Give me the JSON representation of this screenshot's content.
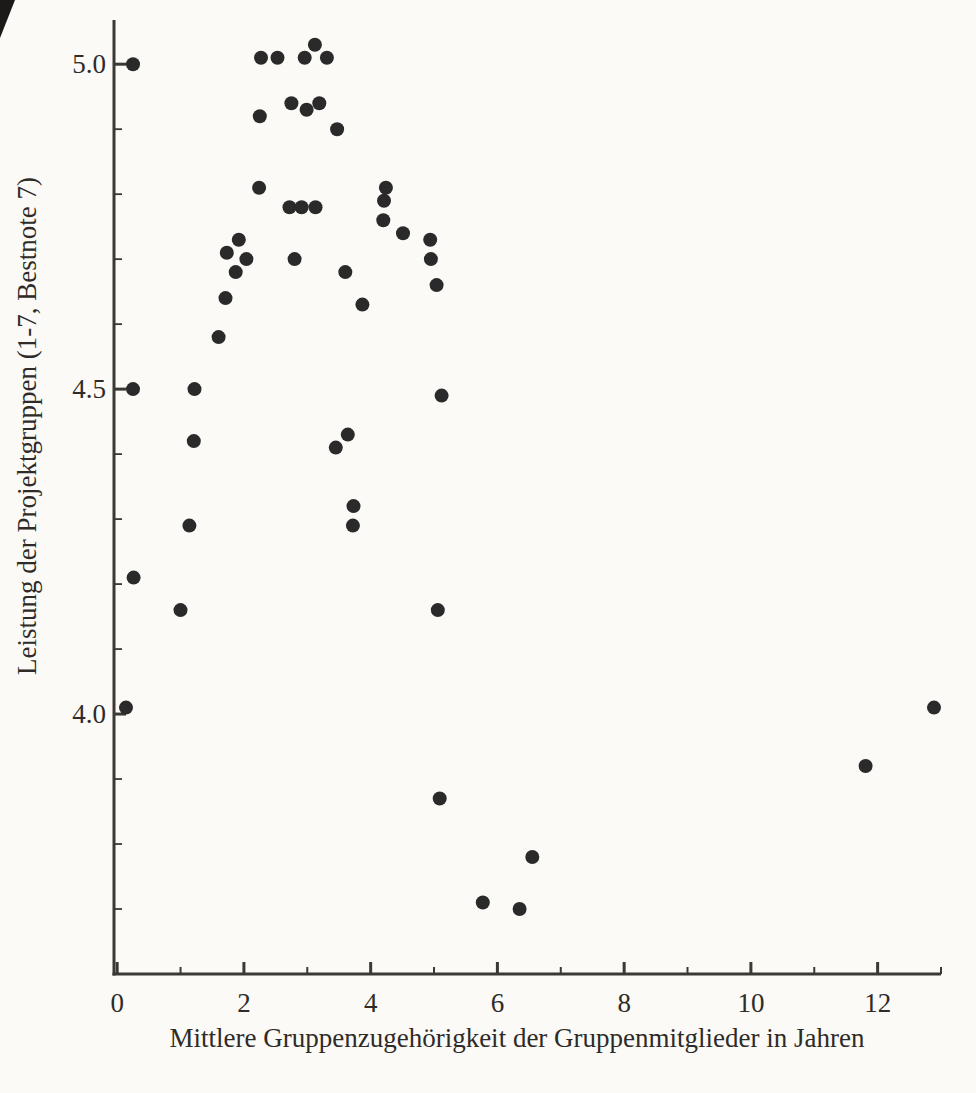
{
  "figure": {
    "background": "#fbfaf6",
    "ink_color": "#2a2a2a",
    "axis_color": "#3b3835",
    "text_color": "#2e2b28"
  },
  "chart_data": {
    "type": "scatter",
    "title": "",
    "xlabel": "Mittlere Gruppenzugehörigkeit der Gruppenmitglieder in Jahren",
    "ylabel": "Leistung der Projektgruppen (1-7, Bestnote 7)",
    "xlim": [
      -0.05,
      13.0
    ],
    "ylim": [
      3.6,
      5.068
    ],
    "grid": false,
    "legend": null,
    "marker": {
      "shape": "circle",
      "radius_px": 7,
      "color": "#2a2a2a"
    },
    "x_major_ticks": [
      0,
      2,
      4,
      6,
      8,
      10,
      12
    ],
    "x_major_tick_labels": [
      "0",
      "2",
      "4",
      "6",
      "8",
      "10",
      "12"
    ],
    "x_minor_ticks": [
      1,
      3,
      5,
      7,
      9,
      11,
      13
    ],
    "y_major_ticks": [
      4.0,
      4.5,
      5.0
    ],
    "y_major_tick_labels": [
      "4.0",
      "4.5",
      "5.0"
    ],
    "y_minor_ticks": [
      3.7,
      3.8,
      3.9,
      4.1,
      4.2,
      4.3,
      4.4,
      4.6,
      4.7,
      4.8,
      4.9
    ],
    "points": [
      [
        0.25,
        5.0
      ],
      [
        2.27,
        5.01
      ],
      [
        2.53,
        5.01
      ],
      [
        2.96,
        5.01
      ],
      [
        3.12,
        5.03
      ],
      [
        3.31,
        5.01
      ],
      [
        2.25,
        4.92
      ],
      [
        2.75,
        4.94
      ],
      [
        2.99,
        4.93
      ],
      [
        3.19,
        4.94
      ],
      [
        3.47,
        4.9
      ],
      [
        2.24,
        4.81
      ],
      [
        2.72,
        4.78
      ],
      [
        2.91,
        4.78
      ],
      [
        3.13,
        4.78
      ],
      [
        4.24,
        4.81
      ],
      [
        4.21,
        4.79
      ],
      [
        4.2,
        4.76
      ],
      [
        4.51,
        4.74
      ],
      [
        4.94,
        4.73
      ],
      [
        4.95,
        4.7
      ],
      [
        1.92,
        4.73
      ],
      [
        1.73,
        4.71
      ],
      [
        2.04,
        4.7
      ],
      [
        1.87,
        4.68
      ],
      [
        2.8,
        4.7
      ],
      [
        3.6,
        4.68
      ],
      [
        5.04,
        4.66
      ],
      [
        1.71,
        4.64
      ],
      [
        3.87,
        4.63
      ],
      [
        1.6,
        4.58
      ],
      [
        0.25,
        4.5
      ],
      [
        1.22,
        4.5
      ],
      [
        5.12,
        4.49
      ],
      [
        1.21,
        4.42
      ],
      [
        3.45,
        4.41
      ],
      [
        3.64,
        4.43
      ],
      [
        3.73,
        4.32
      ],
      [
        3.72,
        4.29
      ],
      [
        1.14,
        4.29
      ],
      [
        0.26,
        4.21
      ],
      [
        1.0,
        4.16
      ],
      [
        5.06,
        4.16
      ],
      [
        0.14,
        4.01
      ],
      [
        5.09,
        3.87
      ],
      [
        6.55,
        3.78
      ],
      [
        5.77,
        3.71
      ],
      [
        6.35,
        3.7
      ],
      [
        11.81,
        3.92
      ],
      [
        12.89,
        4.01
      ]
    ]
  }
}
